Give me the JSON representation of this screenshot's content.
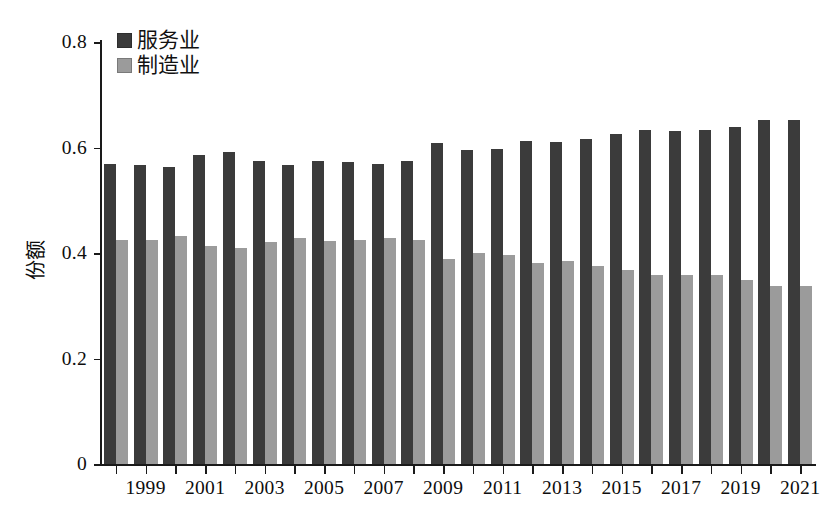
{
  "chart_data": {
    "type": "bar",
    "title": "",
    "subtitle": "",
    "xlabel": "",
    "ylabel": "份额",
    "ylim": [
      0,
      0.8
    ],
    "yticks": [
      "0",
      "0.2",
      "0.4",
      "0.6",
      "0.8"
    ],
    "ytick_values": [
      0,
      0.2,
      0.4,
      0.6,
      0.8
    ],
    "grid": false,
    "legend_position": "top-left",
    "categories": [
      1998,
      1999,
      2000,
      2001,
      2002,
      2003,
      2004,
      2005,
      2006,
      2007,
      2008,
      2009,
      2010,
      2011,
      2012,
      2013,
      2014,
      2015,
      2016,
      2017,
      2018,
      2019,
      2020,
      2021
    ],
    "xtick_labels": [
      "1999",
      "2001",
      "2003",
      "2005",
      "2007",
      "2009",
      "2011",
      "2013",
      "2015",
      "2017",
      "2019",
      "2021"
    ],
    "xtick_categories": [
      1999,
      2001,
      2003,
      2005,
      2007,
      2009,
      2011,
      2013,
      2015,
      2017,
      2019,
      2021
    ],
    "series": [
      {
        "name": "服务业",
        "color": "#3b3b3b",
        "values": [
          0.569,
          0.567,
          0.563,
          0.585,
          0.591,
          0.575,
          0.566,
          0.575,
          0.573,
          0.569,
          0.574,
          0.609,
          0.595,
          0.598,
          0.613,
          0.611,
          0.616,
          0.626,
          0.634,
          0.632,
          0.633,
          0.638,
          0.653,
          0.653
        ]
      },
      {
        "name": "制造业",
        "color": "#9b9b9b",
        "values": [
          0.425,
          0.424,
          0.432,
          0.413,
          0.409,
          0.421,
          0.428,
          0.422,
          0.425,
          0.429,
          0.424,
          0.388,
          0.4,
          0.396,
          0.382,
          0.385,
          0.376,
          0.367,
          0.358,
          0.358,
          0.359,
          0.349,
          0.337,
          0.338
        ]
      }
    ]
  },
  "colors": {
    "services": "#3b3b3b",
    "manufacturing": "#9b9b9b",
    "axis": "#1a1a1a",
    "text": "#0d0d0d",
    "background": "#ffffff"
  }
}
